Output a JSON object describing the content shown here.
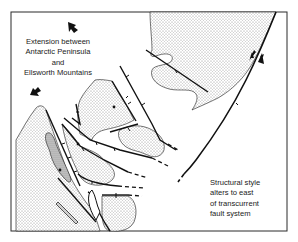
{
  "diagram": {
    "type": "geological structural sketch map",
    "annotations": {
      "extension": {
        "lines": [
          "Extension between",
          "Antarctic Peninsula",
          "and",
          "Ellsworth Mountains"
        ]
      },
      "structural": {
        "lines": [
          "Structural style",
          "alters to east",
          "of transcurrent",
          "fault system"
        ]
      }
    },
    "symbols": {
      "extension_arrows": [
        "arrow-up-left",
        "arrow-down-left"
      ],
      "strike_slip_arrows": [
        "half-arrow-up",
        "half-arrow-down"
      ]
    },
    "colors": {
      "line": "#1a1a1a",
      "stipple": "#9a9a9a",
      "dense_stipple": "#6a6a6a",
      "background": "#ffffff"
    }
  }
}
